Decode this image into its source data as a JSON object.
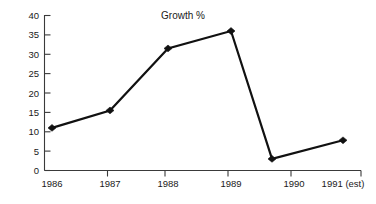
{
  "chart_data": {
    "type": "line",
    "title": "Growth %",
    "xlabel": "",
    "ylabel": "",
    "categories": [
      "1986",
      "1987",
      "1988",
      "1989",
      "1990",
      "1991 (est)"
    ],
    "x_tick_labels": [
      "1986",
      "1987",
      "1988",
      "1989",
      "1991 (est)"
    ],
    "values": [
      11,
      15.5,
      31.5,
      36,
      3,
      7.8
    ],
    "series": [
      {
        "name": "Growth %",
        "values": [
          11,
          15.5,
          31.5,
          36,
          3,
          7.8
        ]
      }
    ],
    "ylim": [
      0,
      40
    ],
    "y_ticks": [
      0,
      5,
      10,
      15,
      20,
      25,
      30,
      35,
      40
    ],
    "y_tick_labels": [
      "0",
      "5",
      "10",
      "15",
      "20",
      "25",
      "30",
      "35",
      "40"
    ],
    "grid": false,
    "legend": false,
    "legend_position": "none",
    "marker": "diamond",
    "line_color": "#111111",
    "marker_color": "#111111",
    "axis_color": "#3a3a3a",
    "background_color": "#ffffff",
    "annotations": []
  },
  "axis_labels": {
    "x0": "1986",
    "x1": "1987",
    "x2": "1988",
    "x3": "1989",
    "x4": "1990",
    "x5": "1991 (est)",
    "y0": "0",
    "y1": "5",
    "y2": "10",
    "y3": "15",
    "y4": "20",
    "y5": "25",
    "y6": "30",
    "y7": "35",
    "y8": "40"
  }
}
